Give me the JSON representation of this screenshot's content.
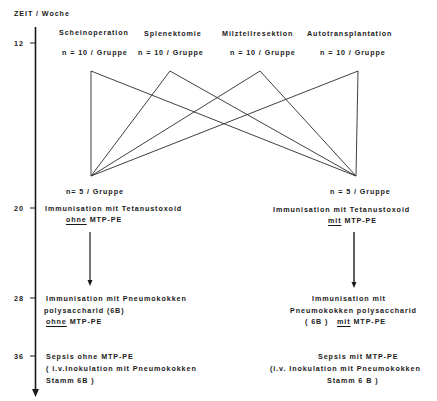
{
  "axis": {
    "title": "ZEIT / Woche",
    "ticks": [
      {
        "label": "12",
        "y": 43
      },
      {
        "label": "20",
        "y": 208
      },
      {
        "label": "28",
        "y": 298
      },
      {
        "label": "36",
        "y": 356
      }
    ]
  },
  "groups": [
    {
      "name": "Scheinoperation",
      "n": "n = 10 / Gruppe"
    },
    {
      "name": "Splenektomie",
      "n": "n = 10 / Gruppe"
    },
    {
      "name": "Milzteilresektion",
      "n": "n = 10 / Gruppe"
    },
    {
      "name": "Autotransplantation",
      "n": "n = 10 / Gruppe"
    }
  ],
  "left_branch": {
    "n": "n= 5 / Gruppe",
    "week20": {
      "line1": "Immunisation mit Tetanustoxoid",
      "qualifier": "ohne",
      "rest": "MTP-PE"
    },
    "week28": {
      "line1": "Immunisation mit Pneumokokken",
      "line2": "polysaccharid (6B)",
      "qualifier": "ohne",
      "rest": "MTP-PE"
    },
    "week36": {
      "line1": "Sepsis ohne MTP-PE",
      "line2": "( i.v.Inokulation mit Pneumokokken",
      "line3": "Stamm 6B )"
    }
  },
  "right_branch": {
    "n": "n = 5 / Gruppe",
    "week20": {
      "line1": "Immunisation mit Tetanustoxoid",
      "qualifier": "mit",
      "rest": "MTP-PE"
    },
    "week28": {
      "line1": "Immunisation mit",
      "line2": "Pneumokokken polysaccharid",
      "prefix": "( 6B )",
      "qualifier": "mit",
      "rest": "MTP-PE"
    },
    "week36": {
      "line1": "Sepsis mit MTP-PE",
      "line2": "(i.v. Inokulation mit Pneumokokken",
      "line3": "Stamm 6 B )"
    }
  }
}
